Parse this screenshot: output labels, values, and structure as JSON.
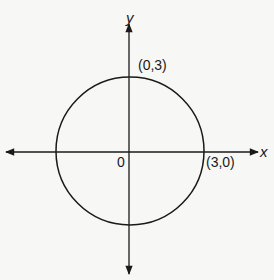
{
  "diagram": {
    "type": "circle on coordinate plane",
    "axes": {
      "x_label": "x",
      "y_label": "y",
      "origin_label": "0"
    },
    "circle": {
      "center": [
        0,
        0
      ],
      "radius": 3
    },
    "points": [
      {
        "label": "(0,3)",
        "x": 0,
        "y": 3
      },
      {
        "label": "(3,0)",
        "x": 3,
        "y": 0
      }
    ],
    "colors": {
      "stroke": "#1a1a1a",
      "background": "#f7f7f5"
    }
  }
}
